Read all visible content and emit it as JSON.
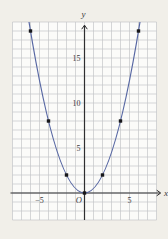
{
  "canvas": {
    "width": 168,
    "height": 239,
    "background_color": "#f1efe9",
    "plot_background_color": "#fbfbf9"
  },
  "style": {
    "grid_color": "#c4c6c9",
    "axis_color": "#2e2e30",
    "curve_color": "#5767a3",
    "point_color": "#17171a",
    "text_color": "#3a3a3c"
  },
  "chart_data": {
    "type": "line",
    "function": "y = x^2 / 2",
    "x": [
      -6,
      -4,
      -2,
      0,
      2,
      4,
      6
    ],
    "y": [
      18,
      8,
      2,
      0,
      2,
      8,
      18
    ],
    "marked_points": [
      [
        -6,
        18
      ],
      [
        -4,
        8
      ],
      [
        -2,
        2
      ],
      [
        0,
        0
      ],
      [
        2,
        2
      ],
      [
        4,
        8
      ],
      [
        6,
        18
      ]
    ],
    "xlabel": "x",
    "ylabel": "y",
    "origin_label": "O",
    "x_tick_values": [
      -5,
      5
    ],
    "x_tick_labels": [
      "−5",
      "5"
    ],
    "y_tick_values": [
      5,
      10,
      15
    ],
    "y_tick_labels": [
      "5",
      "10",
      "15"
    ],
    "xlim": [
      -8,
      8
    ],
    "ylim": [
      -3,
      19
    ],
    "grid": true,
    "grid_step": 1,
    "legend_position": "none"
  }
}
